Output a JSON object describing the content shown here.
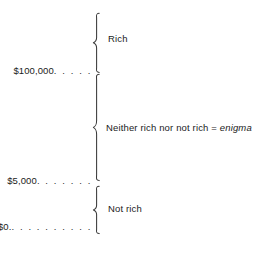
{
  "diagram": {
    "background_color": "#ffffff",
    "text_color": "#1b1b1b",
    "brace_color": "#3a3a3a",
    "axis_labels": [
      {
        "id": "upper",
        "amount": "$100,000",
        "leader": ". . . . ."
      },
      {
        "id": "middle",
        "amount": "$5,000",
        "leader": ". . . . . . ."
      },
      {
        "id": "lower",
        "amount": "$0.",
        "leader": ". . . . . . . . . ."
      }
    ],
    "bands": [
      {
        "id": "rich",
        "label": "Rich",
        "italic_term": "",
        "range_top": "",
        "range_bottom": "$100,000"
      },
      {
        "id": "enigma",
        "label": "Neither rich nor not rich = ",
        "italic_term": "enigma",
        "range_top": "$100,000",
        "range_bottom": "$5,000"
      },
      {
        "id": "not-rich",
        "label": "Not rich",
        "italic_term": "",
        "range_top": "$5,000",
        "range_bottom": "$0."
      }
    ]
  }
}
